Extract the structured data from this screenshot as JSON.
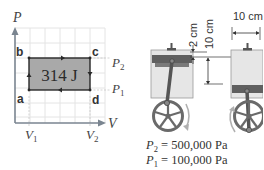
{
  "pv_diagram": {
    "axis_y_label": "P",
    "axis_x_label": "V",
    "work_label": "314 J",
    "points": [
      {
        "name": "a",
        "label": "a"
      },
      {
        "name": "b",
        "label": "b"
      },
      {
        "name": "c",
        "label": "c"
      },
      {
        "name": "d",
        "label": "d"
      }
    ],
    "pressure_labels": {
      "p2": "P",
      "p2_sub": "2",
      "p1": "P",
      "p1_sub": "1"
    },
    "volume_labels": {
      "v1": "V",
      "v1_sub": "1",
      "v2": "V",
      "v2_sub": "2"
    },
    "cycle_direction": "clockwise (a→b→c→d→a)"
  },
  "engine": {
    "dim_stroke": "2 cm",
    "dim_height": "10 cm",
    "dim_width": "10 cm",
    "p2_symbol": "P",
    "p2_sub": "2",
    "p2_value": " = 500,000 Pa",
    "p1_symbol": "P",
    "p1_sub": "1",
    "p1_value": " = 100,000 Pa"
  },
  "colors": {
    "rect_fill": "#a8a8a8",
    "axis": "#7a8590",
    "grid": "#e2e2e2",
    "piston": "#5f5f5f",
    "cylinder": "#e4e4e4",
    "wheel": "#6a6a6a"
  }
}
